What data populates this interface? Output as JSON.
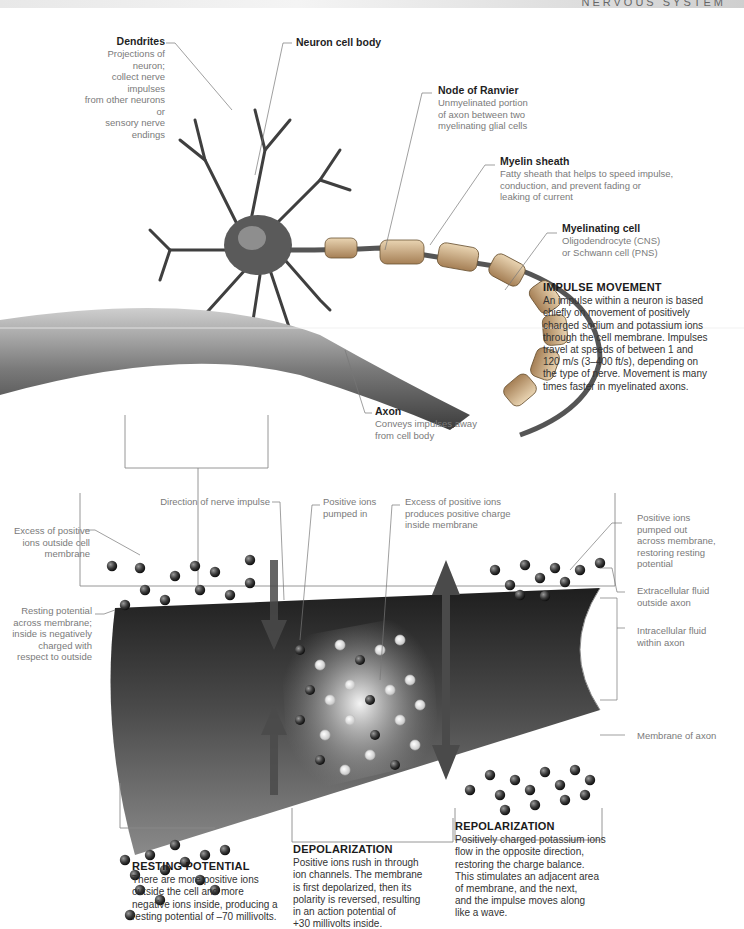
{
  "header": {
    "title": "NERVOUS SYSTEM"
  },
  "top_labels": {
    "dendrites": {
      "title": "Dendrites",
      "desc": [
        "Projections of neuron;",
        "collect nerve impulses",
        "from other neurons or",
        "sensory nerve endings"
      ]
    },
    "cell_body": {
      "title": "Neuron cell body"
    },
    "node_ranvier": {
      "title": "Node of Ranvier",
      "desc": [
        "Unmyelinated portion",
        "of axon between two",
        "myelinating glial cells"
      ]
    },
    "myelin_sheath": {
      "title": "Myelin sheath",
      "desc": [
        "Fatty sheath that helps to speed impulse,",
        "conduction, and prevent fading or",
        "leaking of current"
      ]
    },
    "myelinating_cell": {
      "title": "Myelinating cell",
      "desc": [
        "Oligodendrocyte (CNS)",
        "or Schwann cell (PNS)"
      ]
    },
    "axon": {
      "title": "Axon",
      "desc": [
        "Conveys impulses away",
        "from cell body"
      ]
    }
  },
  "impulse_movement": {
    "heading": "IMPULSE MOVEMENT",
    "lines": [
      "An impulse within a neuron is based",
      "chiefly on movement of positively",
      "charged sodium and potassium ions",
      "through the cell membrane. Impulses",
      "travel at speeds of between 1 and",
      "120 m/s (3–400 ft/s), depending on",
      "the type of nerve. Movement is many",
      "times faster in myelinated axons."
    ]
  },
  "lower_labels": {
    "direction": {
      "desc": [
        "Direction of nerve impulse"
      ]
    },
    "pumped_in": {
      "desc": [
        "Positive ions",
        "pumped in"
      ]
    },
    "excess_inside": {
      "desc": [
        "Excess of positive ions",
        "produces positive charge",
        "inside membrane"
      ]
    },
    "excess_outside": {
      "desc": [
        "Excess of positive",
        "ions outside cell",
        "membrane"
      ]
    },
    "resting_across": {
      "desc": [
        "Resting potential",
        "across membrane;",
        "inside is negatively",
        "charged with",
        "respect to outside"
      ]
    },
    "pumped_out": {
      "desc": [
        "Positive ions",
        "pumped out",
        "across membrane,",
        "restoring resting",
        "potential"
      ]
    },
    "extracellular": {
      "desc": [
        "Extracellular fluid",
        "outside axon"
      ]
    },
    "intracellular": {
      "desc": [
        "Intracellular fluid",
        "within axon"
      ]
    },
    "membrane": {
      "desc": [
        "Membrane of axon"
      ]
    }
  },
  "phases": {
    "resting": {
      "heading": "RESTING POTENTIAL",
      "lines": [
        "There are more positive ions",
        "outside the cell and more",
        "negative ions inside, producing a",
        "resting potential of –70 millivolts."
      ]
    },
    "depolarization": {
      "heading": "DEPOLARIZATION",
      "lines": [
        "Positive ions rush in through",
        "ion channels. The membrane",
        "is first depolarized, then its",
        "polarity is reversed, resulting",
        "in an action potential of",
        "+30 millivolts inside."
      ]
    },
    "repolarization": {
      "heading": "REPOLARIZATION",
      "lines": [
        "Positively charged potassium ions",
        "flow in the opposite direction,",
        "restoring the charge balance.",
        "This stimulates an adjacent area",
        "of membrane, and the next,",
        "and the impulse moves along",
        "like a wave."
      ]
    }
  },
  "colors": {
    "arrow": "#4a4a4a",
    "text": "#222222",
    "caption": "#7a7a7a",
    "axon_dark": "#2e2e2e",
    "myelin": "#c9a77a"
  }
}
